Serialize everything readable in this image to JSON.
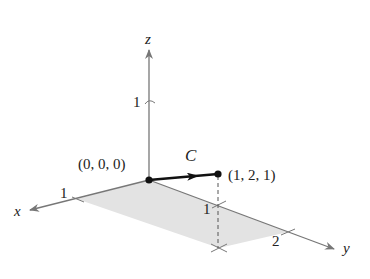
{
  "diagram": {
    "type": "3d-coordinate-plot",
    "axes": {
      "x": {
        "label": "x",
        "ticks": [
          "1"
        ]
      },
      "y": {
        "label": "y",
        "ticks": [
          "1",
          "2"
        ]
      },
      "z": {
        "label": "z",
        "ticks": [
          "1"
        ]
      }
    },
    "curve": {
      "label": "C",
      "start": "(0, 0, 0)",
      "end": "(1, 2, 1)"
    },
    "colors": {
      "axis": "#777777",
      "curve": "#111111",
      "shade": "#e2e2e2"
    }
  }
}
